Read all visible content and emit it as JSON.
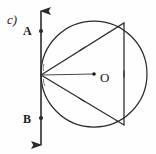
{
  "figure": {
    "part_label": "c)",
    "type": "geometry-diagram",
    "stroke_color": "#2b2b2b",
    "background_color": "#fefefe",
    "labels": [
      {
        "name": "part-label",
        "text": "c)",
        "x": 7,
        "y": 24,
        "size": 13,
        "bold": false,
        "italic": true
      },
      {
        "name": "label-a",
        "text": "A",
        "x": 23,
        "y": 35,
        "size": 12,
        "bold": true,
        "italic": false
      },
      {
        "name": "label-b",
        "text": "B",
        "x": 23,
        "y": 123,
        "size": 12,
        "bold": true,
        "italic": false
      },
      {
        "name": "label-center",
        "text": "O",
        "x": 100,
        "y": 82,
        "size": 13,
        "bold": false,
        "italic": false
      }
    ],
    "circle": {
      "cx": 94,
      "cy": 74,
      "r": 53
    },
    "center_point": {
      "cx": 94,
      "cy": 74,
      "r": 1.8
    },
    "vertical_line": {
      "x": 41,
      "y_top": 11,
      "y_bottom": 145,
      "arrow_top": true,
      "arrow_bottom": true
    },
    "point_markers": [
      {
        "name": "point-a-marker",
        "cx": 41,
        "cy": 31,
        "r": 2.1
      },
      {
        "name": "point-b-marker",
        "cx": 41,
        "cy": 118,
        "r": 2.1
      }
    ],
    "vertex": {
      "x": 41,
      "y": 75
    },
    "triangle_points": "41,75 124,23 124,125",
    "radius_line": {
      "x1": 41,
      "y1": 75,
      "x2": 94,
      "y2": 74
    },
    "congruence_ticks": [
      {
        "name": "tick-upper-side",
        "x": 82,
        "y": 49,
        "angle": -32,
        "length": 7
      },
      {
        "name": "tick-lower-side",
        "x": 82,
        "y": 100,
        "angle": 32,
        "length": 7
      },
      {
        "name": "tick-vertical-side",
        "x": 124,
        "y": 74,
        "angle": 90,
        "length": 7
      }
    ],
    "angle_arcs": [
      {
        "name": "angle-arc-upper",
        "d": "M 44 64 A 11 11 0 0 0 43.5 71"
      },
      {
        "name": "angle-arc-lower",
        "d": "M 43.5 79 A 11 11 0 0 0 45 86"
      }
    ]
  }
}
